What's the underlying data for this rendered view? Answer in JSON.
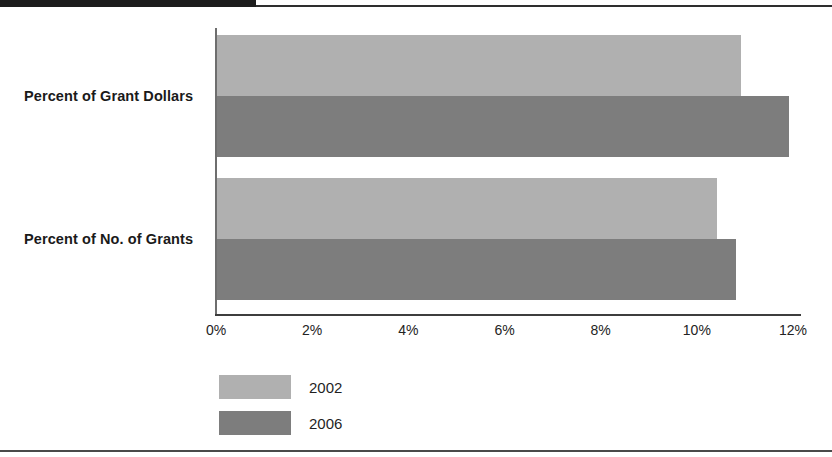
{
  "chart_data": {
    "type": "bar",
    "orientation": "horizontal",
    "title": "",
    "xlabel": "",
    "ylabel": "",
    "categories": [
      "Percent of Grant Dollars",
      "Percent of No. of Grants"
    ],
    "series": [
      {
        "name": "2002",
        "color": "#b0b0b0",
        "values": [
          10.9,
          10.4
        ]
      },
      {
        "name": "2006",
        "color": "#7d7d7d",
        "values": [
          11.9,
          10.8
        ]
      }
    ],
    "xlim": [
      0,
      12
    ],
    "xticks": [
      0,
      2,
      4,
      6,
      8,
      10,
      12
    ],
    "xtick_labels": [
      "0%",
      "2%",
      "4%",
      "6%",
      "8%",
      "10%",
      "12%"
    ],
    "grid": false,
    "legend_position": "bottom-left"
  },
  "legend": {
    "items": [
      {
        "label": "2002",
        "color": "#b0b0b0"
      },
      {
        "label": "2006",
        "color": "#7d7d7d"
      }
    ]
  },
  "colors": {
    "series_2002": "#b0b0b0",
    "series_2006": "#7d7d7d",
    "axis": "#3d3d3d",
    "text": "#1a1a1a",
    "rule": "#2e2e2e"
  }
}
